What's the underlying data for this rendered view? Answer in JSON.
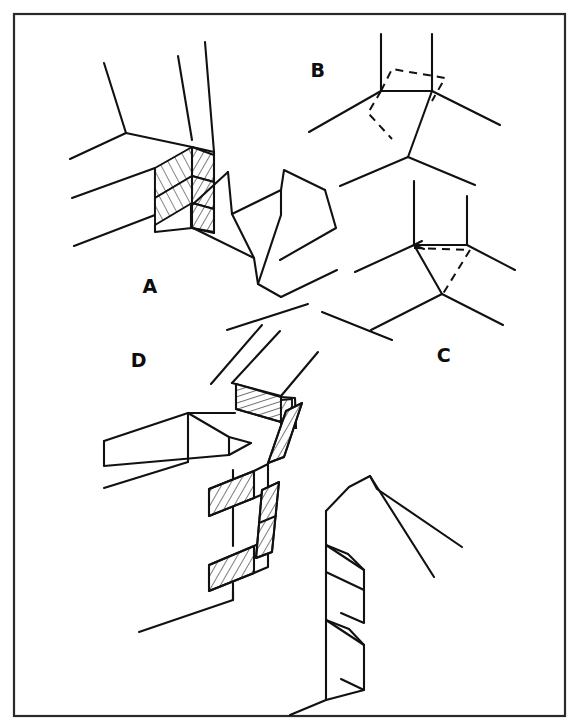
{
  "figure": {
    "background_color": "#ffffff",
    "line_color": "#111111",
    "frame_color": "#2a2a2a",
    "width": 584,
    "height": 727
  },
  "frame": {
    "x": 14,
    "y": 14,
    "width": 551,
    "height": 702
  },
  "panels": [
    {
      "id": "A",
      "label": "A",
      "label_x": 150,
      "label_y": 293,
      "description": "Stepped interlocking block joint with hatched end faces and separated mating member"
    },
    {
      "id": "B",
      "label": "B",
      "label_x": 318,
      "label_y": 77,
      "description": "Three-way line junction with dashed parallelogram overlay"
    },
    {
      "id": "C",
      "label": "C",
      "label_x": 444,
      "label_y": 362,
      "description": "Three-way line junction with dashed triangular overlay"
    },
    {
      "id": "D",
      "label": "D",
      "label_x": 139,
      "label_y": 367,
      "description": "Multi-tier stepped interlocking joint with hatched tongues and separated mating member"
    }
  ]
}
